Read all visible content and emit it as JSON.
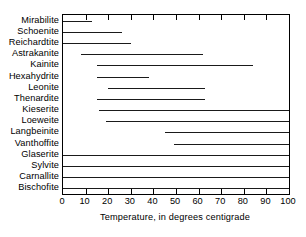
{
  "chart_data": {
    "type": "bar",
    "orientation": "horizontal",
    "title": "",
    "xlabel": "Temperature, in degrees centigrade",
    "ylabel": "",
    "xlim": [
      0,
      100
    ],
    "xticks": [
      0,
      10,
      20,
      30,
      40,
      50,
      60,
      70,
      80,
      90,
      100
    ],
    "xtick_labels": [
      "0",
      "10",
      "20",
      "30",
      "40",
      "50",
      "60",
      "70",
      "80",
      "90",
      "100"
    ],
    "grid": false,
    "legend": null,
    "bar_color": "#1a1a1a",
    "categories": [
      "Mirabilite",
      "Schoenite",
      "Reichardtite",
      "Astrakanite",
      "Kainite",
      "Hexahydrite",
      "Leonite",
      "Thenardite",
      "Kieserite",
      "Loeweite",
      "Langbeinite",
      "Vanthoffite",
      "Glaserite",
      "Sylvite",
      "Carnallite",
      "Bischofite"
    ],
    "ranges": [
      {
        "name": "Mirabilite",
        "start": 0,
        "end": 13
      },
      {
        "name": "Schoenite",
        "start": 0,
        "end": 26
      },
      {
        "name": "Reichardtite",
        "start": 0,
        "end": 30
      },
      {
        "name": "Astrakanite",
        "start": 8,
        "end": 62
      },
      {
        "name": "Kainite",
        "start": 15,
        "end": 84
      },
      {
        "name": "Hexahydrite",
        "start": 15,
        "end": 38
      },
      {
        "name": "Leonite",
        "start": 20,
        "end": 63
      },
      {
        "name": "Thenardite",
        "start": 15,
        "end": 63
      },
      {
        "name": "Kieserite",
        "start": 16,
        "end": 100
      },
      {
        "name": "Loeweite",
        "start": 19,
        "end": 100
      },
      {
        "name": "Langbeinite",
        "start": 45,
        "end": 100
      },
      {
        "name": "Vanthoffite",
        "start": 49,
        "end": 100
      },
      {
        "name": "Glaserite",
        "start": 0,
        "end": 100
      },
      {
        "name": "Sylvite",
        "start": 0,
        "end": 100
      },
      {
        "name": "Carnallite",
        "start": 0,
        "end": 100
      },
      {
        "name": "Bischofite",
        "start": 0,
        "end": 100
      }
    ]
  }
}
